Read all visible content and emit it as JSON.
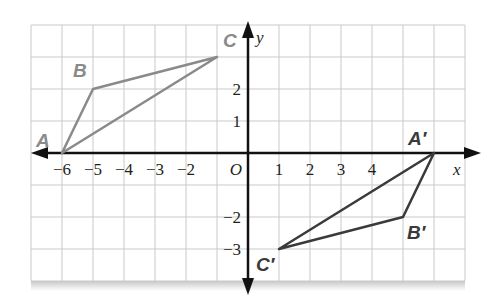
{
  "figure": {
    "grid": {
      "xmin": -7,
      "xmax": 7,
      "ymin": -4,
      "ymax": 4,
      "unit_x_px": 31,
      "unit_y_px": 32,
      "origin_px": [
        248,
        153
      ]
    },
    "axes": {
      "x_label": "x",
      "y_label": "y",
      "origin_label": "O"
    },
    "x_ticks": [
      {
        "value": -6,
        "label": "−6"
      },
      {
        "value": -5,
        "label": "−5"
      },
      {
        "value": -4,
        "label": "−4"
      },
      {
        "value": -3,
        "label": "−3"
      },
      {
        "value": -2,
        "label": "−2"
      },
      {
        "value": 1,
        "label": "1"
      },
      {
        "value": 2,
        "label": "2"
      },
      {
        "value": 3,
        "label": "3"
      },
      {
        "value": 4,
        "label": "4"
      }
    ],
    "y_ticks": [
      {
        "value": 2,
        "label": "2"
      },
      {
        "value": 1,
        "label": "1"
      },
      {
        "value": -2,
        "label": "−2"
      },
      {
        "value": -3,
        "label": "−3"
      }
    ],
    "triangles": [
      {
        "name": "ABC",
        "color": "#8a8a8a",
        "vertices": [
          {
            "label": "A",
            "x": -6,
            "y": 0
          },
          {
            "label": "B",
            "x": -5,
            "y": 2
          },
          {
            "label": "C",
            "x": -1,
            "y": 3
          }
        ]
      },
      {
        "name": "A'B'C'",
        "color": "#3a3a3a",
        "vertices": [
          {
            "label": "A′",
            "x": 6,
            "y": 0
          },
          {
            "label": "B′",
            "x": 5,
            "y": -2
          },
          {
            "label": "C′",
            "x": 1,
            "y": -3
          }
        ]
      }
    ],
    "colors": {
      "grid": "#c9c9c9",
      "axis": "#111111",
      "preimage": "#8a8a8a",
      "image": "#3a3a3a"
    }
  }
}
